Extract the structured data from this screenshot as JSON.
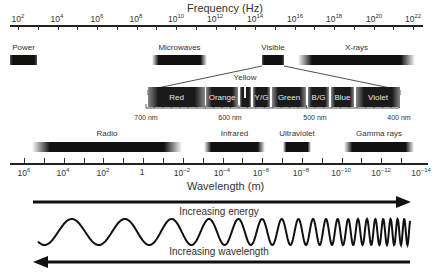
{
  "frequency_axis": {
    "title": "Frequency (Hz)",
    "ticks": [
      {
        "base": "10",
        "exp": "2",
        "x": 18
      },
      {
        "base": "10",
        "exp": "4",
        "x": 57
      },
      {
        "base": "10",
        "exp": "6",
        "x": 97
      },
      {
        "base": "10",
        "exp": "8",
        "x": 136
      },
      {
        "base": "10",
        "exp": "10",
        "x": 176
      },
      {
        "base": "10",
        "exp": "12",
        "x": 215
      },
      {
        "base": "10",
        "exp": "14",
        "x": 255
      },
      {
        "base": "10",
        "exp": "16",
        "x": 295
      },
      {
        "base": "10",
        "exp": "18",
        "x": 334
      },
      {
        "base": "10",
        "exp": "20",
        "x": 374
      },
      {
        "base": "10",
        "exp": "22",
        "x": 413
      }
    ]
  },
  "frequency_bands": [
    {
      "label": "Power",
      "x1": 10,
      "x2": 37
    },
    {
      "label": "Microwaves",
      "x1": 152,
      "x2": 207
    },
    {
      "label": "Visible",
      "x1": 262,
      "x2": 284
    },
    {
      "label": "X-rays",
      "x1": 298,
      "x2": 415
    }
  ],
  "visible_spectrum": {
    "colors": [
      {
        "label": "Red",
        "x1": 148,
        "x2": 205
      },
      {
        "label": "Orange",
        "x1": 206,
        "x2": 238
      },
      {
        "label": "Yellow",
        "x1": 240,
        "x2": 251
      },
      {
        "label": "Y/G",
        "x1": 253,
        "x2": 270
      },
      {
        "label": "Green",
        "x1": 272,
        "x2": 306
      },
      {
        "label": "B/G",
        "x1": 308,
        "x2": 329
      },
      {
        "label": "Blue",
        "x1": 331,
        "x2": 354
      },
      {
        "label": "Violet",
        "x1": 356,
        "x2": 400
      }
    ],
    "yellow_label": "Yellow",
    "nm_ticks": [
      {
        "label": "700 nm",
        "x": 146
      },
      {
        "label": "600 nm",
        "x": 230
      },
      {
        "label": "500 nm",
        "x": 315
      },
      {
        "label": "400 nm",
        "x": 399
      }
    ]
  },
  "wavelength_bands": [
    {
      "label": "Radio",
      "x1": 32,
      "x2": 182
    },
    {
      "label": "Infrared",
      "x1": 204,
      "x2": 265
    },
    {
      "label": "Ultraviolet",
      "x1": 283,
      "x2": 311
    },
    {
      "label": "Gamma rays",
      "x1": 344,
      "x2": 414
    }
  ],
  "wavelength_axis": {
    "title": "Wavelength (m)",
    "ticks": [
      {
        "base": "10",
        "exp": "6",
        "x": 24
      },
      {
        "base": "10",
        "exp": "4",
        "x": 63
      },
      {
        "base": "10",
        "exp": "2",
        "x": 103
      },
      {
        "base": "1",
        "exp": "",
        "x": 142
      },
      {
        "base": "10",
        "exp": "−2",
        "x": 182
      },
      {
        "base": "10",
        "exp": "−4",
        "x": 222
      },
      {
        "base": "10",
        "exp": "−6",
        "x": 261
      },
      {
        "base": "10",
        "exp": "−8",
        "x": 301
      },
      {
        "base": "10",
        "exp": "−10",
        "x": 341
      },
      {
        "base": "10",
        "exp": "−12",
        "x": 381
      },
      {
        "base": "10",
        "exp": "−14",
        "x": 421
      }
    ]
  },
  "arrows": {
    "energy_label": "Increasing energy",
    "wavelength_label": "Increasing wavelength"
  },
  "colors": {
    "ink": "#111111",
    "text": "#333333",
    "background": "#ffffff"
  }
}
